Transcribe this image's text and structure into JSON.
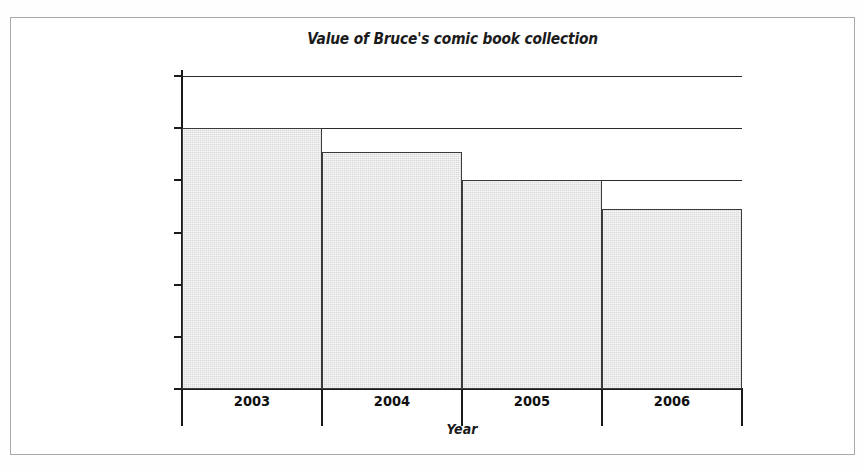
{
  "figure": {
    "background_color": "#ffffff",
    "frame_color": "#a9a9a9"
  },
  "chart_data": {
    "type": "bar",
    "title": "Value of Bruce's comic book collection",
    "xlabel": "Year",
    "ylabel": "",
    "categories": [
      "2003",
      "2004",
      "2005",
      "2006"
    ],
    "values": [
      1000,
      910,
      800,
      690
    ],
    "ylim": [
      0,
      1200
    ],
    "ytick_values": [
      0,
      200,
      400,
      600,
      800,
      1000,
      1200
    ],
    "ytick_labels": [
      "$0",
      "$200",
      "$400",
      "$600",
      "$800",
      "$1,000",
      "$1,200"
    ],
    "gridlines_at": [
      800,
      1000,
      1200
    ],
    "grid": true,
    "legend": false,
    "bar_fill_color": "#d9d9d9",
    "bar_edge_color": "#3a3a3a",
    "axis_color": "#1b1b1b"
  }
}
